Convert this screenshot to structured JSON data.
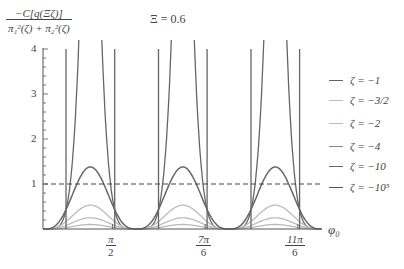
{
  "chart_data": {
    "type": "line",
    "title": "Ξ = 0.6",
    "ylabel_numerator": "−C[q(Ξζ)]",
    "ylabel_denominator": "π₁²(ζ) + π₂²(ζ)",
    "xlabel": "φ₀",
    "ylim": [
      0,
      4
    ],
    "yticks": [
      1,
      2,
      3,
      4
    ],
    "xticks": [
      {
        "num": "π",
        "den": "2",
        "value": 1.5708
      },
      {
        "num": "7π",
        "den": "6",
        "value": 3.6652
      },
      {
        "num": "11π",
        "den": "6",
        "value": 5.7596
      }
    ],
    "reference_line": {
      "y": 1,
      "style": "dashed"
    },
    "period": 2.0944,
    "peak_centers": [
      1.07,
      3.16,
      5.25
    ],
    "series": [
      {
        "name": "ζ = −1",
        "color": "#666666",
        "kind": "steep",
        "description": "near-vertical branches rising past 4 at ±0.26 rad from peak centers"
      },
      {
        "name": "ζ = −3/2",
        "color": "#bbbbbb",
        "kind": "bell",
        "peak": 0.1
      },
      {
        "name": "ζ = −2",
        "color": "#bbbbbb",
        "kind": "bell",
        "peak": 0.25
      },
      {
        "name": "ζ = −4",
        "color": "#bbbbbb",
        "kind": "bell",
        "peak": 0.53
      },
      {
        "name": "ζ = −10",
        "color": "#666666",
        "kind": "bell",
        "peak": 1.38
      },
      {
        "name": "ζ = −10⁵",
        "color": "#666666",
        "kind": "vertical",
        "description": "vertical asymptote lines at ±0.55 rad from peak centers"
      }
    ],
    "legend_position": "right"
  },
  "labels": {
    "title": "Ξ = 0.6",
    "ylabel_num": "−C[q(Ξζ)]",
    "ylabel_den": "π₁²(ζ) + π₂²(ζ)",
    "xlabel": "φ₀",
    "y1": "1",
    "y2": "2",
    "y3": "3",
    "y4": "4",
    "xt1_num": "π",
    "xt1_den": "2",
    "xt2_num": "7π",
    "xt2_den": "6",
    "xt3_num": "11π",
    "xt3_den": "6"
  },
  "legend": [
    {
      "label": "ζ = −1",
      "color": "#666666"
    },
    {
      "label": "ζ = −3/2",
      "color": "#bbbbbb"
    },
    {
      "label": "ζ = −2",
      "color": "#bbbbbb"
    },
    {
      "label": "ζ = −4",
      "color": "#888888"
    },
    {
      "label": "ζ = −10",
      "color": "#666666"
    },
    {
      "label": "ζ = −10⁵",
      "color": "#555555"
    }
  ]
}
